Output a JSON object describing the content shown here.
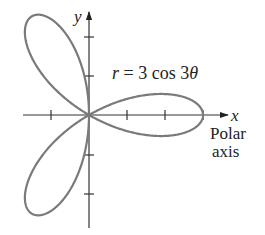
{
  "diagram": {
    "equation": {
      "r": "r",
      "rest": " = 3 cos 3",
      "theta": "θ"
    },
    "axes": {
      "x_label": "x",
      "y_label": "y",
      "polar_axis_line1": "Polar",
      "polar_axis_line2": "axis"
    },
    "curve": {
      "type": "rose",
      "formula": "r = 3 cos 3θ",
      "amplitude": 3,
      "k": 3,
      "petal_angles_deg": [
        0,
        120,
        240
      ]
    },
    "ticks": {
      "x": [
        -1,
        1,
        2,
        3
      ],
      "y": [
        -2,
        -1,
        1,
        2
      ]
    },
    "colors": {
      "curve": "#7a7a7a",
      "axes": "#333333",
      "text": "#222222"
    }
  }
}
